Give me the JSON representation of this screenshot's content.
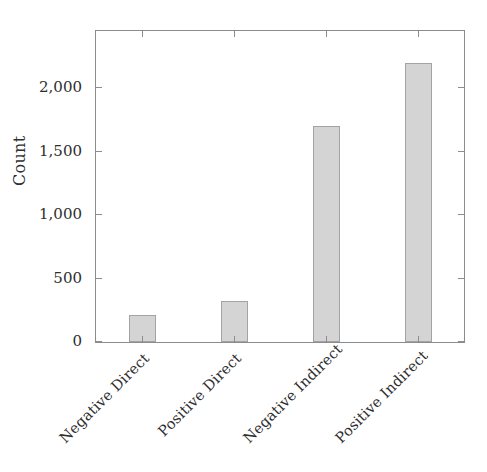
{
  "chart_data": {
    "type": "bar",
    "title": "",
    "subtitle": "",
    "xlabel": "",
    "ylabel": "Count",
    "categories": [
      "Negative Direct",
      "Positive Direct",
      "Negative Indirect",
      "Positive Indirect"
    ],
    "values": [
      210,
      320,
      1700,
      2200
    ],
    "series": [
      {
        "name": "Count",
        "values": [
          210,
          320,
          1700,
          2200
        ]
      }
    ],
    "ylim": [
      0,
      2450
    ],
    "xlim": [
      0,
      4
    ],
    "y_ticks": [
      0,
      500,
      1000,
      1500,
      2000
    ],
    "y_tick_labels": [
      "0",
      "500",
      "1,000",
      "1,500",
      "2,000"
    ],
    "grid": false,
    "legend": false,
    "legend_position": "none",
    "annotations": [],
    "bar_color": "#d4d4d4",
    "bar_edge_color": "#a3a3a3",
    "axis_color": "#8c8c8c",
    "text_color": "#2e2e2e",
    "background_color": "#ffffff",
    "x_tick_rotation": 45,
    "ticks_direction": "in",
    "frame": "full-box"
  }
}
